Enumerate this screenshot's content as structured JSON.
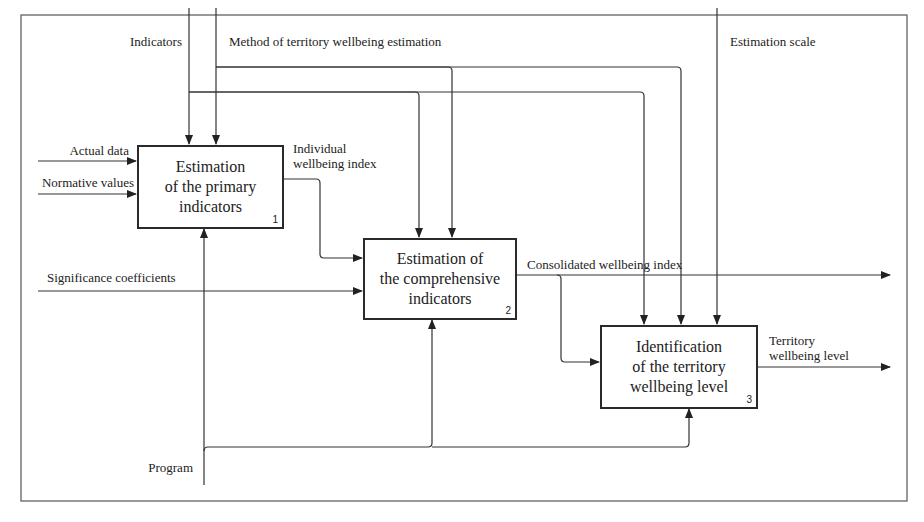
{
  "diagram": {
    "type": "IDEF0",
    "frame": {
      "stroke": "#555555"
    },
    "controls": [
      {
        "id": "indicators",
        "label": "Indicators"
      },
      {
        "id": "method",
        "label": "Method of territory wellbeing estimation"
      },
      {
        "id": "scale",
        "label": "Estimation scale"
      }
    ],
    "inputs": [
      {
        "id": "actual",
        "label": "Actual data"
      },
      {
        "id": "normative",
        "label": "Normative values"
      },
      {
        "id": "significance",
        "label": "Significance coefficients"
      }
    ],
    "mechanisms": [
      {
        "id": "program",
        "label": "Program"
      }
    ],
    "boxes": [
      {
        "id": "box1",
        "title": "Estimation\nof the primary\nindicators",
        "number": "1"
      },
      {
        "id": "box2",
        "title": "Estimation of\nthe comprehensive\nindicators",
        "number": "2"
      },
      {
        "id": "box3",
        "title": "Identification\nof the territory\nwellbeing level",
        "number": "3"
      }
    ],
    "flows": [
      {
        "id": "individual",
        "label_line1": "Individual",
        "label_line2": "wellbeing index"
      },
      {
        "id": "consolidated",
        "label": "Consolidated wellbeing index"
      },
      {
        "id": "territory",
        "label_line1": "Territory",
        "label_line2": "wellbeing level"
      }
    ]
  }
}
